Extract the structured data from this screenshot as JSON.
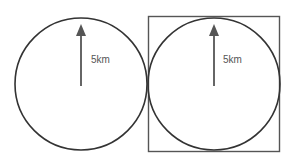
{
  "diagram": {
    "figures": [
      {
        "id": "circle-only",
        "shape": "circle",
        "radius_label": "5km",
        "enclosed_in_square": false
      },
      {
        "id": "circle-in-square",
        "shape": "circle",
        "radius_label": "5km",
        "enclosed_in_square": true
      }
    ],
    "colors": {
      "stroke": "#333333",
      "arrow": "#666666",
      "label": "#555555",
      "background": "#ffffff"
    }
  }
}
